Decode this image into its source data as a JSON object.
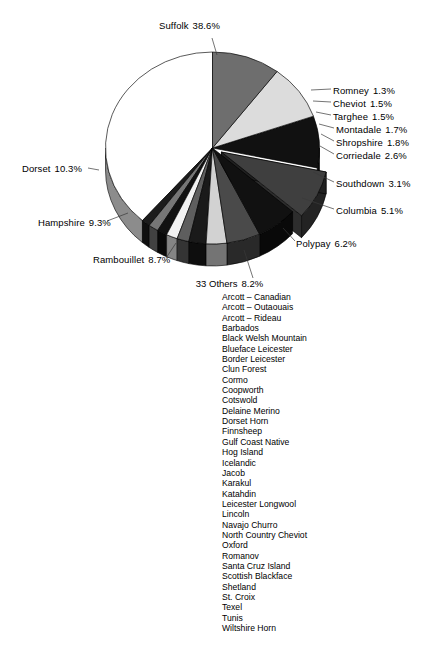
{
  "chart_data": {
    "type": "pie",
    "title": "",
    "subtitle": "",
    "xlabel": "",
    "ylabel": "",
    "units": "percent",
    "exploded_slices": [
      "33 Others"
    ],
    "legend_position": "callout-labels",
    "grid": false,
    "categories": [
      "Suffolk",
      "Romney",
      "Cheviot",
      "Targhee",
      "Montadale",
      "Shropshire",
      "Corriedale",
      "Southdown",
      "Columbia",
      "Polypay",
      "33 Others",
      "Rambouillet",
      "Hampshire",
      "Dorset"
    ],
    "values": [
      38.6,
      1.3,
      1.5,
      1.5,
      1.7,
      1.8,
      2.6,
      3.1,
      5.1,
      6.2,
      8.2,
      8.7,
      9.3,
      10.3
    ],
    "slices": [
      {
        "label": "Suffolk",
        "value": 38.6,
        "value_text": "38.6%",
        "color": "#ffffff"
      },
      {
        "label": "Romney",
        "value": 1.3,
        "value_text": "1.3%",
        "color": "#1c1c1c"
      },
      {
        "label": "Cheviot",
        "value": 1.5,
        "value_text": "1.5%",
        "color": "#767676"
      },
      {
        "label": "Targhee",
        "value": 1.5,
        "value_text": "1.5%",
        "color": "#111111"
      },
      {
        "label": "Montadale",
        "value": 1.7,
        "value_text": "1.7%",
        "color": "#f2f2f2"
      },
      {
        "label": "Shropshire",
        "value": 1.8,
        "value_text": "1.8%",
        "color": "#5e5e5e"
      },
      {
        "label": "Corriedale",
        "value": 2.6,
        "value_text": "2.6%",
        "color": "#1a1a1a"
      },
      {
        "label": "Southdown",
        "value": 3.1,
        "value_text": "3.1%",
        "color": "#d2d2d2"
      },
      {
        "label": "Columbia",
        "value": 5.1,
        "value_text": "5.1%",
        "color": "#4a4a4a"
      },
      {
        "label": "Polypay",
        "value": 6.2,
        "value_text": "6.2%",
        "color": "#111111"
      },
      {
        "label": "33 Others",
        "value": 8.2,
        "value_text": "8.2%",
        "color": "#3f3f3f"
      },
      {
        "label": "Rambouillet",
        "value": 8.7,
        "value_text": "8.7%",
        "color": "#111111"
      },
      {
        "label": "Hampshire",
        "value": 9.3,
        "value_text": "9.3%",
        "color": "#dcdcdc"
      },
      {
        "label": "Dorset",
        "value": 10.3,
        "value_text": "10.3%",
        "color": "#6e6e6e"
      }
    ]
  },
  "labels": {
    "suffolk": {
      "name": "Suffolk",
      "pct": "38.6%"
    },
    "romney": {
      "name": "Romney",
      "pct": "1.3%"
    },
    "cheviot": {
      "name": "Cheviot",
      "pct": "1.5%"
    },
    "targhee": {
      "name": "Targhee",
      "pct": "1.5%"
    },
    "montadale": {
      "name": "Montadale",
      "pct": "1.7%"
    },
    "shropshire": {
      "name": "Shropshire",
      "pct": "1.8%"
    },
    "corriedale": {
      "name": "Corriedale",
      "pct": "2.6%"
    },
    "southdown": {
      "name": "Southdown",
      "pct": "3.1%"
    },
    "columbia": {
      "name": "Columbia",
      "pct": "5.1%"
    },
    "polypay": {
      "name": "Polypay",
      "pct": "6.2%"
    },
    "dorset": {
      "name": "Dorset",
      "pct": "10.3%"
    },
    "hampshire": {
      "name": "Hampshire",
      "pct": "9.3%"
    },
    "rambouillet": {
      "name": "Rambouillet",
      "pct": "8.7%"
    }
  },
  "others": {
    "title": "33 Others",
    "pct": "8.2%",
    "breeds": [
      "Arcott – Canadian",
      "Arcott – Outaouais",
      "Arcott – Rideau",
      "Barbados",
      "Black Welsh Mountain",
      "Blueface Leicester",
      "Border Leicester",
      "Clun Forest",
      "Cormo",
      "Coopworth",
      "Cotswold",
      "Delaine Merino",
      "Dorset Horn",
      "Finnsheep",
      "Gulf Coast Native",
      "Hog Island",
      "Icelandic",
      "Jacob",
      "Karakul",
      "Katahdin",
      "Leicester Longwool",
      "Lincoln",
      "Navajo Churro",
      "North Country Cheviot",
      "Oxford",
      "Romanov",
      "Santa Cruz Island",
      "Scottish Blackface",
      "Shetland",
      "St. Croix",
      "Texel",
      "Tunis",
      "Wiltshire Horn"
    ]
  }
}
